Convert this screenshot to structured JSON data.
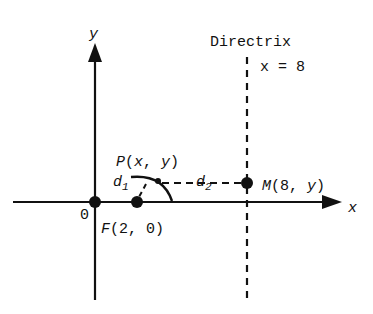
{
  "diagram": {
    "axes": {
      "x_label": "x",
      "y_label": "y",
      "origin_label": "0"
    },
    "directrix": {
      "title": "Directrix",
      "equation": "x = 8"
    },
    "points": {
      "focus": {
        "label": "F(2, 0)"
      },
      "point": {
        "label": "P(x, y)"
      },
      "foot": {
        "label": "M(8, y)"
      }
    },
    "distances": {
      "d1": "d",
      "d1_sub": "1",
      "d2": "d",
      "d2_sub": "2"
    },
    "colors": {
      "ink": "#111111",
      "background": "#ffffff"
    }
  }
}
